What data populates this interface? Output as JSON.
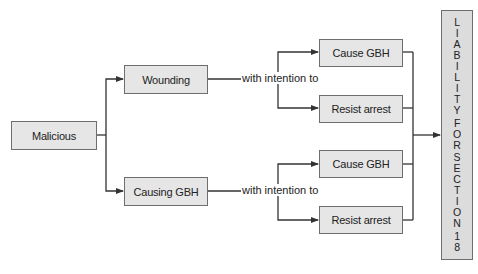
{
  "nodes": {
    "root": "Malicious",
    "branch_a": "Wounding",
    "branch_b": "Causing GBH",
    "a_intent_1": "Cause GBH",
    "a_intent_2": "Resist arrest",
    "b_intent_1": "Cause GBH",
    "b_intent_2": "Resist arrest",
    "result": "LIABILITY FOR SECTION 18"
  },
  "edge_labels": {
    "a": "with intention to",
    "b": "with intention to"
  },
  "colors": {
    "box_fill": "#e6e6e6",
    "box_border": "#6e6e6e",
    "line": "#333333"
  }
}
